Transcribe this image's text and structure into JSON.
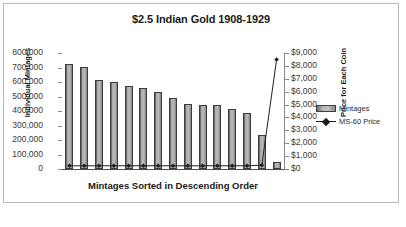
{
  "chart_data": {
    "type": "bar",
    "title": "$2.5 Indian Gold 1908-1929",
    "xlabel": "Mintages Sorted in Descending Order",
    "ylabel": "Individual Mintages",
    "y2label": "Price for Each Coin",
    "ylim": [
      0,
      800000
    ],
    "y2lim": [
      0,
      9000
    ],
    "grid": false,
    "legend_position": "right",
    "categories": [
      "1",
      "2",
      "3",
      "4",
      "5",
      "6",
      "7",
      "8",
      "9",
      "10",
      "11",
      "12",
      "13",
      "14",
      "15"
    ],
    "yticks": [
      "0",
      "100,000",
      "200,000",
      "300,000",
      "400,000",
      "500,000",
      "600,000",
      "700,000",
      "800,000"
    ],
    "ytick_values": [
      0,
      100000,
      200000,
      300000,
      400000,
      500000,
      600000,
      700000,
      800000
    ],
    "y2ticks": [
      "$0",
      "$1,000",
      "$2,000",
      "$3,000",
      "$4,000",
      "$5,000",
      "$6,000",
      "$7,000",
      "$8,000",
      "$9,000"
    ],
    "y2tick_values": [
      0,
      1000,
      2000,
      3000,
      4000,
      5000,
      6000,
      7000,
      8000,
      9000
    ],
    "series": [
      {
        "name": "Mintages",
        "type": "bar",
        "axis": "left",
        "color": "#b4b4b4",
        "values": [
          725000,
          705000,
          615000,
          603000,
          574000,
          560000,
          528000,
          490000,
          446000,
          442000,
          439000,
          413000,
          383000,
          235000,
          46000
        ]
      },
      {
        "name": "MS-60 Price",
        "type": "line",
        "axis": "right",
        "color": "#1f1f1f",
        "values": [
          250,
          250,
          250,
          250,
          250,
          250,
          250,
          250,
          250,
          250,
          250,
          250,
          250,
          300,
          8500
        ]
      }
    ]
  },
  "legend": {
    "items": [
      {
        "label": "Mintages",
        "marker": "bar-swatch"
      },
      {
        "label": "MS-60 Price",
        "marker": "line-diamond"
      }
    ]
  },
  "colors": {
    "bar_fill": "#b4b4b4",
    "bar_edge": "#3d3d3d",
    "line": "#1f1f1f",
    "axis": "#8a8a8a",
    "frame_border": "#b9b9b9",
    "background": "#ffffff",
    "text": "#1a1a1a"
  }
}
